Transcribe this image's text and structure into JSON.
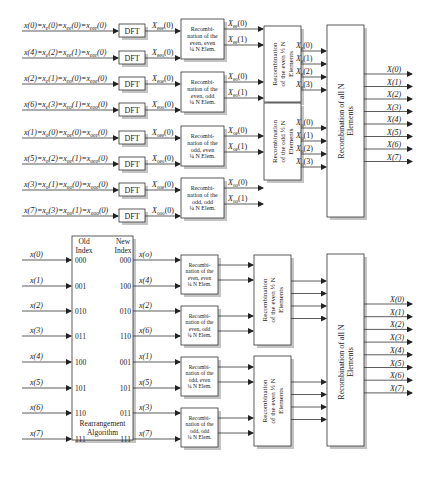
{
  "top": {
    "inputs": [
      {
        "main": "x(0)=x",
        "s1": "e",
        "a1": "(0)=x",
        "s2": "ee",
        "a2": "(0)=x",
        "s3": "eee",
        "a3": "(0)"
      },
      {
        "main": "x(4)=x",
        "s1": "e",
        "a1": "(2)=x",
        "s2": "ee",
        "a2": "(1)=x",
        "s3": "eee",
        "a3": "(0)"
      },
      {
        "main": "x(2)=x",
        "s1": "e",
        "a1": "(1)=x",
        "s2": "eo",
        "a2": "(0)=x",
        "s3": "eoe",
        "a3": "(0)"
      },
      {
        "main": "x(6)=x",
        "s1": "e",
        "a1": "(3)=x",
        "s2": "eo",
        "a2": "(1)=x",
        "s3": "eoo",
        "a3": "(0)"
      },
      {
        "main": "x(1)=x",
        "s1": "o",
        "a1": "(0)=x",
        "s2": "oe",
        "a2": "(0)=x",
        "s3": "oee",
        "a3": "(0)"
      },
      {
        "main": "x(5)=x",
        "s1": "o",
        "a1": "(2)=x",
        "s2": "oe",
        "a2": "(1)=x",
        "s3": "oeo",
        "a3": "(0)"
      },
      {
        "main": "x(3)=x",
        "s1": "o",
        "a1": "(1)=x",
        "s2": "oo",
        "a2": "(0)=x",
        "s3": "ooe",
        "a3": "(0)"
      },
      {
        "main": "x(7)=x",
        "s1": "o",
        "a1": "(3)=x",
        "s2": "oo",
        "a2": "(1)=x",
        "s3": "ooo",
        "a3": "(0)"
      }
    ],
    "dft_label": "DFT",
    "dft_outputs": [
      {
        "main": "X",
        "sub": "eee",
        "arg": "(0)"
      },
      {
        "main": "X",
        "sub": "eeo",
        "arg": "(0)"
      },
      {
        "main": "X",
        "sub": "eoe",
        "arg": "(0)"
      },
      {
        "main": "X",
        "sub": "eoo",
        "arg": "(0)"
      },
      {
        "main": "X",
        "sub": "oee",
        "arg": "(0)"
      },
      {
        "main": "X",
        "sub": "oeo",
        "arg": "(0)"
      },
      {
        "main": "X",
        "sub": "ooe",
        "arg": "(0)"
      },
      {
        "main": "X",
        "sub": "ooo",
        "arg": "(0)"
      }
    ],
    "quarter_blocks": [
      {
        "lines": [
          "Recombi-",
          "nation of the",
          "even, even",
          "¼ N Elem."
        ]
      },
      {
        "lines": [
          "Recombi-",
          "nation of the",
          "even, odd",
          "¼ N Elem."
        ]
      },
      {
        "lines": [
          "Recombi-",
          "nation of the",
          "odd, even",
          "¼ N Elem."
        ]
      },
      {
        "lines": [
          "Recombi-",
          "nation of the",
          "odd, odd",
          "¼ N Elem."
        ]
      }
    ],
    "quarter_outputs": [
      {
        "main": "X",
        "sub": "ee",
        "arg": "(0)"
      },
      {
        "main": "X",
        "sub": "ee",
        "arg": "(1)"
      },
      {
        "main": "X",
        "sub": "eo",
        "arg": "(0)"
      },
      {
        "main": "X",
        "sub": "eo",
        "arg": "(1)"
      },
      {
        "main": "X",
        "sub": "oe",
        "arg": "(0)"
      },
      {
        "main": "X",
        "sub": "oe",
        "arg": "(1)"
      },
      {
        "main": "X",
        "sub": "oo",
        "arg": "(0)"
      },
      {
        "main": "X",
        "sub": "oo",
        "arg": "(1)"
      }
    ],
    "half_blocks": [
      {
        "lines": [
          "Recombination",
          "of the even ½ N",
          "Elements"
        ]
      },
      {
        "lines": [
          "Recombination",
          "of the odd ½ N",
          "Elements"
        ]
      }
    ],
    "half_outputs": [
      {
        "main": "X",
        "sub": "e",
        "arg": "(0)"
      },
      {
        "main": "X",
        "sub": "e",
        "arg": "(1)"
      },
      {
        "main": "X",
        "sub": "e",
        "arg": "(2)"
      },
      {
        "main": "X",
        "sub": "e",
        "arg": "(3)"
      },
      {
        "main": "X",
        "sub": "o",
        "arg": "(0)"
      },
      {
        "main": "X",
        "sub": "o",
        "arg": "(1)"
      },
      {
        "main": "X",
        "sub": "o",
        "arg": "(2)"
      },
      {
        "main": "X",
        "sub": "o",
        "arg": "(3)"
      }
    ],
    "final_block": {
      "lines": [
        "Recombination of all N",
        "Elements"
      ]
    },
    "outputs": [
      "X(0)",
      "X(1)",
      "X(2)",
      "X(3)",
      "X(4)",
      "X(5)",
      "X(6)",
      "X(7)"
    ]
  },
  "bottom": {
    "rearrange": {
      "old_header": [
        "Old",
        "Index"
      ],
      "new_header": [
        "New",
        "Index"
      ],
      "footer": [
        "Rearrangement",
        "Algorithm"
      ],
      "inputs": [
        "x(0)",
        "x(1)",
        "x(2)",
        "x(3)",
        "x(4)",
        "x(5)",
        "x(6)",
        "x(7)"
      ],
      "old_index": [
        "000",
        "001",
        "010",
        "011",
        "100",
        "101",
        "110",
        "111"
      ],
      "new_index": [
        "000",
        "100",
        "010",
        "110",
        "001",
        "101",
        "011",
        "111"
      ],
      "outputs": [
        "x(o)",
        "x(4)",
        "x(2)",
        "x(6)",
        "x(1)",
        "x(5)",
        "x(3)",
        "x(7)"
      ]
    },
    "quarter_blocks": [
      {
        "lines": [
          "Recombi-",
          "nation of the",
          "even, even",
          "¼ N Elem."
        ]
      },
      {
        "lines": [
          "Recombi-",
          "nation of the",
          "even, odd",
          "¼ N Elem."
        ]
      },
      {
        "lines": [
          "Recombi-",
          "nation of the",
          "odd, even",
          "¼ N Elem."
        ]
      },
      {
        "lines": [
          "Recombi-",
          "nation of the",
          "odd, odd",
          "¼ N Elem."
        ]
      }
    ],
    "half_blocks": [
      {
        "lines": [
          "Recombination",
          "of the even ½ N",
          "Elements"
        ]
      },
      {
        "lines": [
          "Recombination",
          "of the even ½ N",
          "Elements"
        ]
      }
    ],
    "final_block": {
      "lines": [
        "Recombination of all N",
        "Elements"
      ]
    },
    "outputs": [
      "X(0)",
      "X(1)",
      "X(2)",
      "X(3)",
      "X(4)",
      "X(5)",
      "X(6)",
      "X(7)"
    ]
  }
}
